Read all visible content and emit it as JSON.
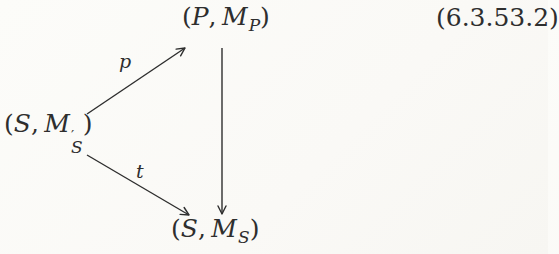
{
  "page": {
    "kind": "scanned math book excerpt",
    "background_color": "#faf9f6",
    "ink_color": "#2e2e2e"
  },
  "equation_number": "(6.3.53.2)",
  "diagram": {
    "type": "commutative-triangle",
    "nodes": {
      "top": {
        "open": "(",
        "v1": "P",
        "comma": ",",
        "v2": "M",
        "sub": "P",
        "close": ")"
      },
      "left": {
        "open": "(",
        "v1": "S",
        "comma": ",",
        "v2": "M",
        "prime": "′",
        "sub": "S",
        "close": ")"
      },
      "bottom": {
        "open": "(",
        "v1": "S",
        "comma": ",",
        "v2": "M",
        "sub": "S",
        "close": ")"
      }
    },
    "arrows": {
      "p": {
        "label": "p",
        "from": "left-node",
        "to": "top-node"
      },
      "vertical": {
        "label": "",
        "from": "top-node",
        "to": "bottom-node"
      },
      "t": {
        "label": "t",
        "from": "left-node",
        "to": "bottom-node"
      }
    }
  }
}
